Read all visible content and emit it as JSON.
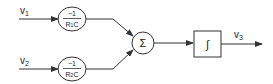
{
  "diagram": {
    "type": "block-diagram",
    "inputs": [
      {
        "id": "v1",
        "label": "v",
        "sub": "1"
      },
      {
        "id": "v2",
        "label": "v",
        "sub": "2"
      }
    ],
    "gains": [
      {
        "numerator": "−1",
        "den_r": "R",
        "den_sub": "1",
        "den_c": "C"
      },
      {
        "numerator": "−1",
        "den_r": "R",
        "den_sub": "2",
        "den_c": "C"
      }
    ],
    "summer": {
      "symbol": "Σ"
    },
    "integrator": {
      "symbol": "∫"
    },
    "output": {
      "label": "v",
      "sub": "3"
    },
    "colors": {
      "stroke": "#333333",
      "background": "#ffffff"
    }
  }
}
